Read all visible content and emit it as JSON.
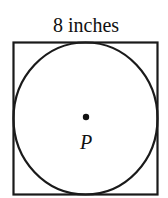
{
  "diagram": {
    "side_label": "8 inches",
    "center_label": "P",
    "shapes": {
      "square": {
        "x": 13.5,
        "y": 42.5,
        "width": 144,
        "height": 152,
        "stroke": "#1a1a1a",
        "stroke_width": 2.2
      },
      "circle": {
        "cx": 85.5,
        "cy": 118.5,
        "rx": 72,
        "ry": 76,
        "stroke": "#1a1a1a",
        "stroke_width": 2.2
      },
      "center_point": {
        "cx": 86,
        "cy": 117,
        "r": 3.2,
        "fill": "#111111"
      }
    }
  }
}
